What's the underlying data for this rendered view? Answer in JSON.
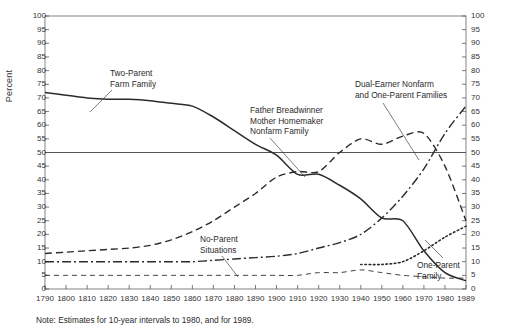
{
  "chart_data": {
    "type": "line",
    "title": "",
    "xlabel": "",
    "ylabel": "Percent",
    "xlim": [
      1790,
      1989
    ],
    "ylim": [
      0,
      100
    ],
    "grid": false,
    "legend_position": "inline-annotations",
    "reference_line": 50,
    "x": [
      1790,
      1800,
      1810,
      1820,
      1830,
      1840,
      1850,
      1860,
      1870,
      1880,
      1890,
      1900,
      1910,
      1920,
      1930,
      1940,
      1950,
      1960,
      1970,
      1980,
      1989
    ],
    "xtick_labels": [
      "1790",
      "1800",
      "1810",
      "1820",
      "1830",
      "1840",
      "1850",
      "1860",
      "1870",
      "1880",
      "1890",
      "1900",
      "1910",
      "1920",
      "1930",
      "1940",
      "1950",
      "1960",
      "1970",
      "1980",
      "1989"
    ],
    "ytick_labels": [
      "0",
      "5",
      "10",
      "15",
      "20",
      "25",
      "30",
      "35",
      "40",
      "45",
      "50",
      "55",
      "60",
      "65",
      "70",
      "75",
      "80",
      "85",
      "90",
      "95",
      "100"
    ],
    "series": [
      {
        "name": "Two-Parent Farm Family",
        "style": "solid",
        "values": [
          72,
          71,
          70,
          69.5,
          69.5,
          69,
          68,
          67,
          63,
          58,
          53,
          49,
          42,
          42,
          38,
          33,
          26,
          25,
          14,
          6,
          3
        ]
      },
      {
        "name": "Father Breadwinner Mother Homemaker Nonfarm Family",
        "style": "dashed",
        "values": [
          13,
          13.5,
          14,
          14.5,
          15,
          16,
          18,
          21,
          25,
          30,
          35,
          41,
          43,
          43,
          50,
          55,
          53,
          56,
          57,
          45,
          25
        ]
      },
      {
        "name": "Dual-Earner Nonfarm and One-Parent Families",
        "style": "dash-dot",
        "values": [
          10,
          10,
          10,
          10,
          10,
          10,
          10,
          10,
          10.5,
          11,
          11.5,
          12,
          13,
          15,
          17,
          20,
          26,
          34,
          44,
          57,
          67
        ]
      },
      {
        "name": "One-Parent Family",
        "style": "dotted",
        "values": [
          null,
          null,
          null,
          null,
          null,
          null,
          null,
          null,
          null,
          null,
          null,
          null,
          null,
          null,
          null,
          9,
          9,
          10,
          14,
          19,
          23
        ]
      },
      {
        "name": "No-Parent Situations",
        "style": "thin-dashed",
        "values": [
          5,
          5,
          5,
          5,
          5,
          5,
          5,
          5,
          5,
          5,
          5,
          5,
          5,
          6,
          6,
          7,
          6,
          5,
          4.5,
          4,
          4
        ]
      }
    ],
    "annotations": [
      {
        "id": "two-parent-farm-family",
        "text_lines": [
          "Two-Parent",
          "Farm Family"
        ]
      },
      {
        "id": "father-breadwinner",
        "text_lines": [
          "Father Breadwinner",
          "Mother Homemaker",
          "Nonfarm Family"
        ]
      },
      {
        "id": "dual-earner",
        "text_lines": [
          "Dual-Earner Nonfarm",
          "and One-Parent Families"
        ]
      },
      {
        "id": "no-parent-situations",
        "text_lines": [
          "No-Parent",
          "Situations"
        ]
      },
      {
        "id": "one-parent-family",
        "text_lines": [
          "One-Parent",
          "Family"
        ]
      }
    ]
  },
  "note": "Note:  Estimates for 10-year intervals to 1980, and for 1989.",
  "axis": {
    "y_label": "Percent"
  },
  "annotations": {
    "two_parent_l1": "Two-Parent",
    "two_parent_l2": "Farm Family",
    "father_l1": "Father Breadwinner",
    "father_l2": "Mother Homemaker",
    "father_l3": "Nonfarm Family",
    "dual_l1": "Dual-Earner Nonfarm",
    "dual_l2": "and One-Parent Families",
    "noparent_l1": "No-Parent",
    "noparent_l2": "Situations",
    "oneparent_l1": "One-Parent",
    "oneparent_l2": "Family"
  },
  "colors": {
    "ink": "#2b2b2b",
    "axis": "#555555",
    "background": "#ffffff"
  }
}
